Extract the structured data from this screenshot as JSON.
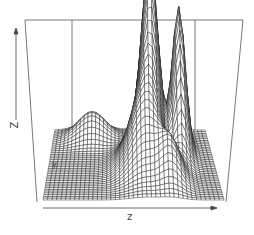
{
  "chart_data": {
    "type": "surface",
    "title": "",
    "xlabel": "z",
    "ylabel": "y",
    "zlabel": "Z",
    "grid_resolution": [
      40,
      40
    ],
    "style": "wireframe perspective (persp), no tick labels, axis arrows only",
    "peaks": [
      {
        "description": "main peak",
        "x": 0.62,
        "y": 0.72,
        "height": 1.0
      },
      {
        "description": "secondary peak",
        "x": 0.8,
        "y": 0.66,
        "height": 0.82
      },
      {
        "description": "broad ridge",
        "x": 0.55,
        "y": 0.45,
        "height": 0.45
      },
      {
        "description": "flat shoulder",
        "x": 0.2,
        "y": 0.85,
        "height": 0.18
      }
    ],
    "line_color": "#222222",
    "box_color": "#555555"
  },
  "axes": {
    "z_label": "Z",
    "x_label": "z",
    "y_label": "y"
  }
}
